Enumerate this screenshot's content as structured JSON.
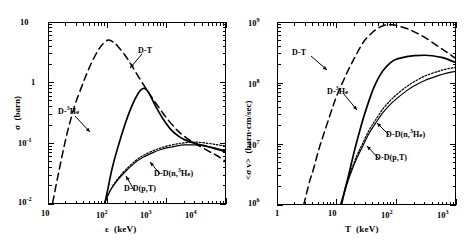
{
  "panels": [
    {
      "id": "cross-section",
      "x_axis": {
        "symbol": "ε",
        "units": "(keV)",
        "ticks": [
          "10",
          "10",
          "10",
          "10"
        ],
        "tick_exponents": [
          "",
          "2",
          "3",
          "4"
        ],
        "min": 10,
        "max": 10000
      },
      "y_axis": {
        "symbol": "σ",
        "units": "(barn)",
        "ticks": [
          "10",
          "1",
          "10",
          "10"
        ],
        "tick_exponents": [
          "",
          "",
          "-1",
          "-2"
        ],
        "min": 0.01,
        "max": 10
      },
      "labels": [
        {
          "text": "D-T",
          "sup": ""
        },
        {
          "text": "D-",
          "sup": "3",
          "tail": "He"
        },
        {
          "text": "D-D(n,",
          "sup": "3",
          "tail": "He)"
        },
        {
          "text": "D-D(p,T)",
          "sup": ""
        }
      ]
    },
    {
      "id": "reactivity",
      "x_axis": {
        "symbol": "T",
        "units": "(keV)",
        "ticks": [
          "1",
          "10",
          "10",
          "10"
        ],
        "tick_exponents": [
          "",
          "",
          "2",
          "3"
        ],
        "min": 1,
        "max": 1000
      },
      "y_axis": {
        "symbol": "<σ v>",
        "units": "(barn·cm/sec)",
        "ticks": [
          "10",
          "10",
          "10",
          "10"
        ],
        "tick_exponents": [
          "9",
          "8",
          "7",
          "6"
        ],
        "min": 1000000,
        "max": 1000000000
      },
      "labels": [
        {
          "text": "D-T",
          "sup": ""
        },
        {
          "text": "D-",
          "sup": "3",
          "tail": "He"
        },
        {
          "text": "D-D(n,",
          "sup": "3",
          "tail": "He)"
        },
        {
          "text": "D-D(p,T)",
          "sup": ""
        }
      ]
    }
  ],
  "chart_data": [
    {
      "type": "line",
      "id": "cross-section",
      "title": "",
      "xlabel": "ε (keV)",
      "ylabel": "σ (barn)",
      "xscale": "log",
      "yscale": "log",
      "xlim": [
        10,
        10000
      ],
      "ylim": [
        0.01,
        10
      ],
      "grid": false,
      "legend": "inline-annotations",
      "series": [
        {
          "name": "D-T",
          "style": "dashed",
          "x": [
            12,
            15,
            20,
            25,
            30,
            40,
            50,
            60,
            70,
            80,
            100,
            120,
            150,
            200,
            250,
            300,
            400,
            500,
            700,
            1000,
            1500,
            2000,
            3000,
            5000,
            7000,
            10000
          ],
          "y": [
            0.0105,
            0.032,
            0.12,
            0.28,
            0.5,
            1.05,
            1.8,
            2.6,
            3.4,
            4.1,
            5.0,
            4.8,
            4.0,
            2.8,
            2.0,
            1.5,
            0.95,
            0.68,
            0.42,
            0.26,
            0.165,
            0.13,
            0.1,
            0.075,
            0.063,
            0.05
          ]
        },
        {
          "name": "D-3He",
          "style": "solid",
          "x": [
            90,
            100,
            120,
            150,
            200,
            250,
            300,
            350,
            400,
            450,
            500,
            600,
            700,
            900,
            1200,
            1600,
            2000,
            3000,
            5000,
            7000,
            10000
          ],
          "y": [
            0.0098,
            0.016,
            0.038,
            0.085,
            0.21,
            0.38,
            0.56,
            0.72,
            0.8,
            0.78,
            0.68,
            0.48,
            0.36,
            0.24,
            0.165,
            0.13,
            0.115,
            0.1,
            0.088,
            0.08,
            0.072
          ]
        },
        {
          "name": "D-D(n,3He)",
          "style": "dotted",
          "x": [
            88,
            100,
            120,
            150,
            200,
            300,
            400,
            600,
            800,
            1000,
            1500,
            2000,
            3000,
            5000,
            7000,
            10000
          ],
          "y": [
            0.0098,
            0.0135,
            0.019,
            0.026,
            0.036,
            0.052,
            0.063,
            0.076,
            0.084,
            0.09,
            0.098,
            0.102,
            0.105,
            0.1,
            0.095,
            0.09
          ]
        },
        {
          "name": "D-D(p,T)",
          "style": "solid-thin",
          "x": [
            88,
            100,
            120,
            150,
            200,
            300,
            400,
            600,
            800,
            1000,
            1500,
            2000,
            3000,
            5000,
            7000,
            10000
          ],
          "y": [
            0.0098,
            0.0132,
            0.0185,
            0.025,
            0.034,
            0.049,
            0.059,
            0.071,
            0.079,
            0.084,
            0.091,
            0.094,
            0.094,
            0.088,
            0.082,
            0.076
          ]
        }
      ]
    },
    {
      "type": "line",
      "id": "reactivity",
      "title": "",
      "xlabel": "T (keV)",
      "ylabel": "<σ v> (barn·cm/sec)",
      "xscale": "log",
      "yscale": "log",
      "xlim": [
        1,
        1000
      ],
      "ylim": [
        1000000,
        1000000000
      ],
      "grid": false,
      "legend": "inline-annotations",
      "series": [
        {
          "name": "D-T",
          "style": "dashed",
          "x": [
            2.8,
            3.5,
            4,
            5,
            6,
            8,
            10,
            13,
            16,
            20,
            25,
            30,
            40,
            50,
            60,
            70,
            80,
            100,
            150,
            200,
            300,
            500,
            700,
            1000
          ],
          "y": [
            1000000,
            2400000,
            3600000,
            8000000,
            14000000,
            33000000,
            61000000,
            110000000,
            170000000,
            260000000,
            390000000,
            510000000,
            680000000,
            800000000,
            870000000,
            900000000,
            900000000,
            880000000,
            780000000,
            690000000,
            560000000,
            400000000,
            320000000,
            250000000
          ]
        },
        {
          "name": "D-3He",
          "style": "solid",
          "x": [
            12,
            14,
            16,
            20,
            25,
            30,
            40,
            50,
            60,
            80,
            100,
            150,
            200,
            300,
            400,
            600,
            800,
            1000
          ],
          "y": [
            1000000,
            1900000,
            3200000,
            8000000,
            18000000,
            33000000,
            75000000,
            120000000,
            160000000,
            215000000,
            245000000,
            270000000,
            280000000,
            285000000,
            280000000,
            260000000,
            235000000,
            215000000
          ]
        },
        {
          "name": "D-D(n,3He)",
          "style": "dotted",
          "x": [
            11.5,
            13,
            15,
            18,
            22,
            27,
            35,
            45,
            60,
            80,
            100,
            150,
            200,
            300,
            500,
            700,
            1000
          ],
          "y": [
            1000000,
            1500000,
            2400000,
            4000000,
            6600000,
            10000000,
            17000000,
            25000000,
            38000000,
            52000000,
            64000000,
            88000000,
            105000000,
            130000000,
            155000000,
            170000000,
            180000000
          ]
        },
        {
          "name": "D-D(p,T)",
          "style": "solid-thin",
          "x": [
            11.5,
            13,
            15,
            18,
            22,
            27,
            35,
            45,
            60,
            80,
            100,
            150,
            200,
            300,
            500,
            700,
            1000
          ],
          "y": [
            980000,
            1430000,
            2250000,
            3700000,
            6000000,
            9000000,
            15000000,
            22000000,
            33000000,
            45000000,
            55000000,
            75000000,
            90000000,
            110000000,
            132000000,
            145000000,
            155000000
          ]
        }
      ]
    }
  ]
}
